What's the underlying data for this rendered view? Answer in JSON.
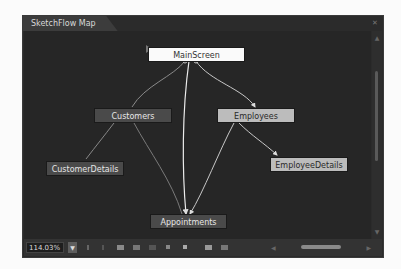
{
  "panel": {
    "title": "SketchFlow Map",
    "close_icon": "close-icon"
  },
  "map": {
    "nodes": [
      {
        "id": "main",
        "label": "MainScreen",
        "style": "start-screen"
      },
      {
        "id": "customers",
        "label": "Customers",
        "style": "dark"
      },
      {
        "id": "employees",
        "label": "Employees",
        "style": "light"
      },
      {
        "id": "customer_details",
        "label": "CustomerDetails",
        "style": "dark"
      },
      {
        "id": "employee_details",
        "label": "EmployeeDetails",
        "style": "light"
      },
      {
        "id": "appointments",
        "label": "Appointments",
        "style": "dark"
      }
    ],
    "links": [
      {
        "from": "MainScreen",
        "to": "Customers"
      },
      {
        "from": "MainScreen",
        "to": "Employees"
      },
      {
        "from": "MainScreen",
        "to": "Appointments"
      },
      {
        "from": "Customers",
        "to": "CustomerDetails"
      },
      {
        "from": "Customers",
        "to": "Appointments"
      },
      {
        "from": "Employees",
        "to": "EmployeeDetails"
      },
      {
        "from": "Employees",
        "to": "Appointments"
      }
    ]
  },
  "toolbar": {
    "zoom_value": "114.03%",
    "zoom_dropdown_icon": "chevron-down-icon",
    "buttons": [
      "undo-icon",
      "redo-icon",
      "new-screen-icon",
      "new-component-icon",
      "insert-icon",
      "connect-icon",
      "stop-icon",
      "fit-icon",
      "navigate-icon"
    ]
  },
  "scrollbars": {
    "vertical": "vertical-scrollbar",
    "horizontal": "horizontal-scrollbar"
  }
}
